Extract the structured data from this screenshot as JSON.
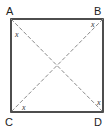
{
  "diagram": {
    "type": "square-with-diagonals",
    "vertices": {
      "A": {
        "label": "A",
        "x": 11,
        "y": 19
      },
      "B": {
        "label": "B",
        "x": 103,
        "y": 19
      },
      "C": {
        "label": "C",
        "x": 11,
        "y": 112
      },
      "D": {
        "label": "D",
        "x": 103,
        "y": 112
      }
    },
    "diagonals": [
      "AD",
      "BC"
    ],
    "angle_marks": [
      {
        "at": "A",
        "label": "x"
      },
      {
        "at": "B",
        "label": "x"
      },
      {
        "at": "C",
        "label": "x"
      },
      {
        "at": "D",
        "label": "x"
      }
    ],
    "colors": {
      "outline": "#222222",
      "diagonal": "#8a8a8a"
    }
  }
}
